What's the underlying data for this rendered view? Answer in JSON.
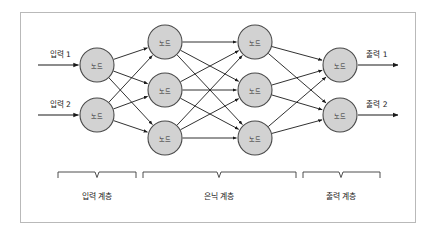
{
  "figure": {
    "title_visible": false,
    "background_color": "#ffffff",
    "frame_color": "#b9b9b9",
    "node_fill_color": "#d2d2d2",
    "node_stroke_color": "#4a4a4a",
    "edge_color": "#1a1a1a"
  },
  "node_label": "노드",
  "inputs": [
    {
      "label": "입력 1"
    },
    {
      "label": "입력 2"
    }
  ],
  "outputs": [
    {
      "label": "출력 1"
    },
    {
      "label": "출력 2"
    }
  ],
  "layers": [
    {
      "id": "input-layer",
      "label": "입력 계층",
      "node_count": 2
    },
    {
      "id": "hidden-layer",
      "label": "은닉 계층",
      "node_count": 6
    },
    {
      "id": "output-layer",
      "label": "출력 계층",
      "node_count": 2
    }
  ],
  "chart_data": {
    "type": "diagram",
    "title": "",
    "columns": [
      {
        "name": "input",
        "x": 97,
        "nodes": [
          {
            "label": "노드",
            "x": 97,
            "y": 65,
            "r": 17
          },
          {
            "label": "노드",
            "x": 97,
            "y": 115,
            "r": 17
          }
        ]
      },
      {
        "name": "hidden-1",
        "x": 165,
        "nodes": [
          {
            "label": "노드",
            "x": 165,
            "y": 42,
            "r": 17
          },
          {
            "label": "노드",
            "x": 165,
            "y": 90,
            "r": 17
          },
          {
            "label": "노드",
            "x": 165,
            "y": 138,
            "r": 17
          }
        ]
      },
      {
        "name": "hidden-2",
        "x": 255,
        "nodes": [
          {
            "label": "노드",
            "x": 255,
            "y": 42,
            "r": 17
          },
          {
            "label": "노드",
            "x": 255,
            "y": 90,
            "r": 17
          },
          {
            "label": "노드",
            "x": 255,
            "y": 138,
            "r": 17
          }
        ]
      },
      {
        "name": "output",
        "x": 340,
        "nodes": [
          {
            "label": "노드",
            "x": 340,
            "y": 65,
            "r": 17
          },
          {
            "label": "노드",
            "x": 340,
            "y": 115,
            "r": 17
          }
        ]
      }
    ],
    "connectivity": "fully-connected between adjacent columns",
    "edge_count": 2,
    "braces": [
      {
        "label": "입력 계층",
        "x1": 58,
        "x2": 136,
        "y": 172,
        "center_x": 97,
        "label_y": 196
      },
      {
        "label": "은닉 계층",
        "x1": 143,
        "x2": 296,
        "y": 172,
        "center_x": 219,
        "label_y": 196
      },
      {
        "label": "출력 계층",
        "x1": 303,
        "x2": 380,
        "y": 172,
        "center_x": 341,
        "label_y": 196
      }
    ]
  }
}
